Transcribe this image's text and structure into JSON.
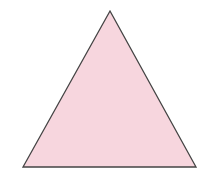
{
  "diagram": {
    "shape": "triangle",
    "type": "equilateral",
    "vertices": [
      [
        110,
        11
      ],
      [
        196,
        167
      ],
      [
        23,
        167
      ]
    ],
    "fill_color": "#f7d6de",
    "stroke_color": "#444444",
    "stroke_width": 1.3,
    "background": "#ffffff"
  }
}
